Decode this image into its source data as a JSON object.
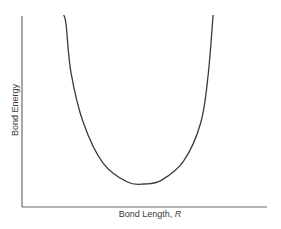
{
  "chart_data": {
    "type": "line",
    "title": "",
    "xlabel": "Bond Length, R",
    "xlabel_text": "Bond Length, ",
    "xlabel_symbol": "R",
    "ylabel": "Bond Energy",
    "grid": false,
    "legend": null,
    "ticks": false,
    "series": [
      {
        "name": "Bond energy curve",
        "points_normalized": [
          {
            "x": 0.17,
            "y": 1.0
          },
          {
            "x": 0.18,
            "y": 0.95
          },
          {
            "x": 0.2,
            "y": 0.7
          },
          {
            "x": 0.25,
            "y": 0.44
          },
          {
            "x": 0.33,
            "y": 0.23
          },
          {
            "x": 0.43,
            "y": 0.13
          },
          {
            "x": 0.5,
            "y": 0.12
          },
          {
            "x": 0.57,
            "y": 0.14
          },
          {
            "x": 0.66,
            "y": 0.24
          },
          {
            "x": 0.73,
            "y": 0.44
          },
          {
            "x": 0.76,
            "y": 0.69
          },
          {
            "x": 0.78,
            "y": 1.0
          }
        ],
        "color": "#3a3a3a"
      }
    ],
    "minimum": {
      "x": 0.5,
      "y": 0.12,
      "label": "equilibrium bond length"
    }
  },
  "colors": {
    "axis": "#6a6a6a",
    "curve": "#3a3a3a",
    "text": "#3a3a3a",
    "background": "#ffffff"
  }
}
